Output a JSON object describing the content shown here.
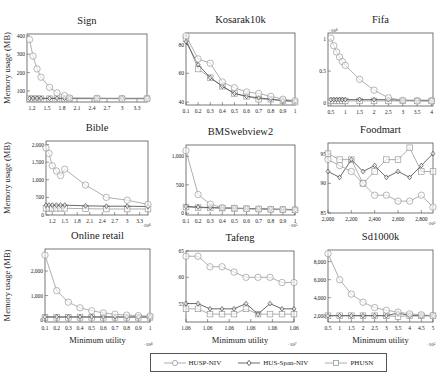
{
  "figure": {
    "ylabel": "Memory usage (MB)",
    "xlabel": "Minimum utility"
  },
  "legend": {
    "items": [
      {
        "label": "HUSP-NIV",
        "marker": "circle"
      },
      {
        "label": "HUS-Span-NIV",
        "marker": "diamond"
      },
      {
        "label": "PHUSN",
        "marker": "square"
      }
    ]
  },
  "chart_data": [
    {
      "type": "line",
      "title": "Sign",
      "xlabel": "",
      "ylabel": "Memory usage (MB)",
      "x": [
        1.15,
        1.22,
        1.3,
        1.38,
        1.55,
        1.7,
        1.85,
        1.95,
        2.5,
        3.0,
        3.5
      ],
      "xticks": [
        "1.2",
        "1.5",
        "1.8",
        "2.1",
        "2.4",
        "2.7",
        "3",
        "3.3"
      ],
      "xtick_vals": [
        1.2,
        1.5,
        1.8,
        2.1,
        2.4,
        2.7,
        3.0,
        3.3
      ],
      "xlim": [
        1.1,
        3.5
      ],
      "ylim": [
        40,
        410
      ],
      "yticks": [
        100,
        200,
        300,
        400
      ],
      "ytick_labels": [
        "100",
        "200",
        "300",
        "400"
      ],
      "xmultiplier": "",
      "series": [
        {
          "name": "HUSP-NIV",
          "values": [
            380,
            290,
            220,
            175,
            120,
            90,
            75,
            62,
            60,
            58,
            58
          ]
        },
        {
          "name": "HUS-Span-NIV",
          "values": [
            60,
            60,
            60,
            60,
            60,
            60,
            60,
            60,
            60,
            60,
            60
          ]
        },
        {
          "name": "PHUSN",
          "values": [
            58,
            58,
            58,
            58,
            58,
            58,
            58,
            58,
            58,
            58,
            58
          ]
        }
      ]
    },
    {
      "type": "line",
      "title": "Kosarak10k",
      "xlabel": "",
      "ylabel": "",
      "x": [
        0.1,
        0.2,
        0.3,
        0.4,
        0.5,
        0.6,
        0.7,
        0.8,
        0.9,
        1.0
      ],
      "xticks": [
        "0.1",
        "0.2",
        "0.3",
        "0.4",
        "0.5",
        "0.6",
        "0.7",
        "0.8",
        "0.9",
        "1"
      ],
      "xtick_vals": [
        0.1,
        0.2,
        0.3,
        0.4,
        0.5,
        0.6,
        0.7,
        0.8,
        0.9,
        1.0
      ],
      "xlim": [
        0.1,
        1.0
      ],
      "ylim": [
        38,
        88
      ],
      "yticks": [
        40,
        60,
        80
      ],
      "ytick_labels": [
        "40",
        "60",
        "80"
      ],
      "xmultiplier": "",
      "series": [
        {
          "name": "HUSP-NIV",
          "values": [
            86,
            70,
            67,
            54,
            50,
            47,
            46,
            44,
            42,
            41
          ]
        },
        {
          "name": "HUS-Span-NIV",
          "values": [
            82,
            66,
            57,
            51,
            46,
            44,
            43,
            42,
            41,
            41
          ]
        },
        {
          "name": "PHUSN",
          "values": [
            84,
            63,
            57,
            51,
            46,
            44,
            42,
            42,
            41,
            40
          ]
        }
      ]
    },
    {
      "type": "line",
      "title": "Fifa",
      "xlabel": "",
      "ylabel": "",
      "x": [
        0.5,
        0.6,
        0.7,
        0.8,
        0.9,
        1.0,
        1.5,
        2.0,
        2.5,
        3.0,
        3.5,
        4.0
      ],
      "xticks": [
        "0.5",
        "1",
        "1.5",
        "2",
        "2.5",
        "3",
        "3.5",
        "4"
      ],
      "xtick_vals": [
        0.5,
        1,
        1.5,
        2,
        2.5,
        3,
        3.5,
        4
      ],
      "xlim": [
        0.4,
        4.05
      ],
      "ylim": [
        -0.05,
        1.1
      ],
      "yticks": [
        0,
        0.5,
        1
      ],
      "ytick_labels": [
        "0",
        "0.5",
        "1"
      ],
      "ymultiplier": "·10⁴",
      "xmultiplier": "",
      "series": [
        {
          "name": "HUSP-NIV",
          "values": [
            1.02,
            0.9,
            0.8,
            0.72,
            0.65,
            0.59,
            0.37,
            0.2,
            0.08,
            0.04,
            0.03,
            0.03
          ]
        },
        {
          "name": "HUS-Span-NIV",
          "values": [
            0.05,
            0.05,
            0.05,
            0.05,
            0.05,
            0.05,
            0.05,
            0.05,
            0.05,
            0.04,
            0.04,
            0.04
          ]
        },
        {
          "name": "PHUSN",
          "values": [
            0.03,
            0.03,
            0.03,
            0.03,
            0.03,
            0.03,
            0.03,
            0.03,
            0.03,
            0.03,
            0.03,
            0.03
          ]
        }
      ]
    },
    {
      "type": "line",
      "title": "Bible",
      "xlabel": "",
      "ylabel": "Memory usage (MB)",
      "x": [
        1.05,
        1.12,
        1.2,
        1.3,
        1.4,
        1.5,
        2.0,
        2.5,
        3.0,
        3.5
      ],
      "xticks": [
        "1.2",
        "1.5",
        "1.8",
        "2.1",
        "2.4",
        "2.7",
        "3",
        "3.3"
      ],
      "xtick_vals": [
        1.2,
        1.5,
        1.8,
        2.1,
        2.4,
        2.7,
        3.0,
        3.3
      ],
      "xlim": [
        1.05,
        3.5
      ],
      "ylim": [
        0,
        2100
      ],
      "yticks": [
        0,
        500,
        1000,
        1500,
        2000
      ],
      "ytick_labels": [
        "0",
        "500",
        "1,000",
        "1,500",
        "2,000"
      ],
      "xmultiplier": "·10⁴",
      "series": [
        {
          "name": "HUSP-NIV",
          "values": [
            1900,
            1750,
            1400,
            1250,
            1120,
            1300,
            850,
            500,
            420,
            300
          ]
        },
        {
          "name": "HUS-Span-NIV",
          "values": [
            280,
            280,
            280,
            280,
            280,
            280,
            260,
            250,
            250,
            240
          ]
        },
        {
          "name": "PHUSN",
          "values": [
            190,
            190,
            190,
            190,
            190,
            190,
            180,
            170,
            170,
            170
          ]
        }
      ]
    },
    {
      "type": "line",
      "title": "BMSwebview2",
      "xlabel": "",
      "ylabel": "",
      "x": [
        0.1,
        0.2,
        0.3,
        0.4,
        0.5,
        0.6,
        0.7,
        0.8,
        0.9,
        1.0
      ],
      "xticks": [
        "0.1",
        "0.2",
        "0.3",
        "0.4",
        "0.5",
        "0.6",
        "0.7",
        "0.8",
        "0.9",
        "1"
      ],
      "xtick_vals": [
        0.1,
        0.2,
        0.3,
        0.4,
        0.5,
        0.6,
        0.7,
        0.8,
        0.9,
        1.0
      ],
      "xlim": [
        0.1,
        1.0
      ],
      "ylim": [
        -30,
        1200
      ],
      "yticks": [
        0,
        500,
        1000
      ],
      "ytick_labels": [
        "0",
        "500",
        "1,000"
      ],
      "xmultiplier": "·10⁵",
      "series": [
        {
          "name": "HUSP-NIV",
          "values": [
            1100,
            330,
            160,
            100,
            90,
            80,
            75,
            70,
            65,
            60
          ]
        },
        {
          "name": "HUS-Span-NIV",
          "values": [
            120,
            110,
            100,
            95,
            90,
            85,
            80,
            75,
            70,
            65
          ]
        },
        {
          "name": "PHUSN",
          "values": [
            110,
            100,
            95,
            90,
            85,
            80,
            75,
            70,
            65,
            60
          ]
        }
      ]
    },
    {
      "type": "line",
      "title": "Foodmart",
      "xlabel": "",
      "ylabel": "",
      "x": [
        2000,
        2100,
        2200,
        2300,
        2400,
        2500,
        2600,
        2700,
        2800,
        2900
      ],
      "xticks": [
        "2,000",
        "2,200",
        "2,400",
        "2,600",
        "2,800"
      ],
      "xtick_vals": [
        2000,
        2200,
        2400,
        2600,
        2800
      ],
      "xlim": [
        2000,
        2900
      ],
      "ylim": [
        85,
        96.8
      ],
      "yticks": [
        85,
        90,
        95
      ],
      "ytick_labels": [
        "85",
        "90",
        "95"
      ],
      "xmultiplier": "·10⁵",
      "series": [
        {
          "name": "HUSP-NIV",
          "values": [
            94,
            93,
            92,
            90,
            88,
            88,
            87,
            87,
            88,
            86
          ]
        },
        {
          "name": "HUS-Span-NIV",
          "values": [
            92,
            91,
            94,
            92,
            93,
            91,
            92,
            91,
            93,
            95
          ]
        },
        {
          "name": "PHUSN",
          "values": [
            95,
            94,
            94,
            90,
            92,
            94,
            94,
            96,
            92,
            92
          ]
        }
      ]
    },
    {
      "type": "line",
      "title": "Online retail",
      "xlabel": "Minimum utility",
      "ylabel": "Memory usage (MB)",
      "x": [
        0.1,
        0.2,
        0.3,
        0.4,
        0.5,
        0.6,
        0.7,
        0.8,
        0.9,
        1.0
      ],
      "xticks": [
        "0.1",
        "0.2",
        "0.3",
        "0.4",
        "0.5",
        "0.6",
        "0.7",
        "0.8",
        "0.9",
        "1"
      ],
      "xtick_vals": [
        0.1,
        0.2,
        0.3,
        0.4,
        0.5,
        0.6,
        0.7,
        0.8,
        0.9,
        1.0
      ],
      "xlim": [
        0.1,
        1.0
      ],
      "ylim": [
        -80,
        2900
      ],
      "yticks": [
        0,
        1000,
        2000
      ],
      "ytick_labels": [
        "0",
        "1,000",
        "2,000"
      ],
      "xmultiplier": "·10⁴",
      "series": [
        {
          "name": "HUSP-NIV",
          "values": [
            2650,
            1200,
            730,
            500,
            380,
            290,
            240,
            200,
            180,
            160
          ]
        },
        {
          "name": "HUS-Span-NIV",
          "values": [
            130,
            130,
            130,
            130,
            130,
            130,
            130,
            130,
            130,
            130
          ]
        },
        {
          "name": "PHUSN",
          "values": [
            110,
            110,
            110,
            110,
            110,
            110,
            110,
            110,
            110,
            110
          ]
        }
      ]
    },
    {
      "type": "line",
      "title": "Tafeng",
      "xlabel": "Minimum utility",
      "ylabel": "",
      "x": [
        1,
        2,
        3,
        4,
        5,
        6,
        7,
        8,
        9,
        10
      ],
      "xticks": [
        "1.06",
        "1.06",
        "1.06",
        "1.06",
        "1.06",
        "1.06"
      ],
      "xtick_vals": [
        1,
        2.8,
        4.6,
        6.4,
        8.2,
        10
      ],
      "xlim": [
        1,
        10
      ],
      "ylim": [
        51.5,
        65
      ],
      "yticks": [
        55,
        60,
        65
      ],
      "ytick_labels": [
        "55",
        "60",
        "65"
      ],
      "xmultiplier": "·10⁷",
      "series": [
        {
          "name": "HUSP-NIV",
          "values": [
            64,
            64,
            62,
            62,
            61,
            60,
            60,
            60,
            59,
            59
          ]
        },
        {
          "name": "HUS-Span-NIV",
          "values": [
            55,
            55,
            54,
            54,
            54,
            55,
            53,
            55,
            54,
            54
          ]
        },
        {
          "name": "PHUSN",
          "values": [
            54,
            54,
            53,
            53,
            53,
            54,
            53,
            53,
            53,
            53
          ]
        }
      ]
    },
    {
      "type": "line",
      "title": "Sd1000k",
      "xlabel": "Minimum utility",
      "ylabel": "",
      "x": [
        0.5,
        1,
        1.5,
        2,
        2.5,
        3,
        3.5,
        4,
        4.5,
        5
      ],
      "xticks": [
        "0.5",
        "1",
        "1.5",
        "2",
        "2.5",
        "3",
        "3.5",
        "4",
        "4.5",
        "5"
      ],
      "xtick_vals": [
        0.5,
        1,
        1.5,
        2,
        2.5,
        3,
        3.5,
        4,
        4.5,
        5
      ],
      "xlim": [
        0.5,
        5
      ],
      "ylim": [
        1300,
        9300
      ],
      "yticks": [
        2000,
        4000,
        6000,
        8000
      ],
      "ytick_labels": [
        "2,000",
        "4,000",
        "6,000",
        "8,000"
      ],
      "xmultiplier": "·10⁵",
      "series": [
        {
          "name": "HUSP-NIV",
          "values": [
            8900,
            6000,
            4400,
            3500,
            2900,
            2600,
            2400,
            2200,
            2100,
            2000
          ]
        },
        {
          "name": "HUS-Span-NIV",
          "values": [
            2000,
            2000,
            2000,
            2000,
            2000,
            2000,
            2300,
            2000,
            2000,
            2000
          ]
        },
        {
          "name": "PHUSN",
          "values": [
            2000,
            2000,
            2000,
            2000,
            2000,
            2000,
            1900,
            2000,
            2000,
            2000
          ]
        }
      ]
    }
  ],
  "layout": {
    "panels": [
      {
        "left": 27,
        "top": 34,
        "width": 120,
        "height": 68
      },
      {
        "left": 186,
        "top": 33,
        "width": 109,
        "height": 72
      },
      {
        "left": 328,
        "top": 33,
        "width": 105,
        "height": 73
      },
      {
        "left": 46,
        "top": 141,
        "width": 102,
        "height": 74
      },
      {
        "left": 186,
        "top": 145,
        "width": 109,
        "height": 70
      },
      {
        "left": 328,
        "top": 143,
        "width": 105,
        "height": 70
      },
      {
        "left": 45,
        "top": 249,
        "width": 105,
        "height": 73
      },
      {
        "left": 186,
        "top": 251,
        "width": 108,
        "height": 71
      },
      {
        "left": 328,
        "top": 250,
        "width": 105,
        "height": 72
      }
    ]
  }
}
